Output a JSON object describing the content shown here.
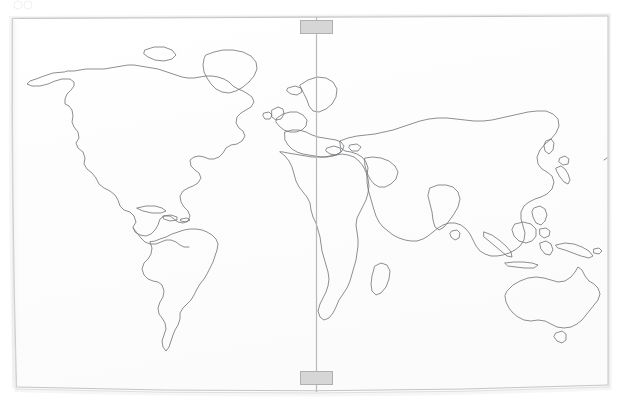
{
  "canvas": {
    "width": 621,
    "height": 403,
    "background_color": "#ffffff",
    "paper_fill": "#fefefe",
    "paper_border_color": "#c9c9c9",
    "paper_shadow_color": "#e8e8e8"
  },
  "map": {
    "title": "World map outline",
    "projection_note": "equirectangular world outline",
    "outline_color": "#6f7276",
    "outline_width": 0.8,
    "fill": "none",
    "frame": {
      "left": 11,
      "top": 17,
      "right": 608,
      "bottom": 385,
      "border_color": "#c4c4c4"
    }
  },
  "guide_line": {
    "name": "vertical-guide-line",
    "orientation": "vertical",
    "x": 316,
    "y_start": 17,
    "y_end": 392,
    "color": "#b9b9b9",
    "width": 1.2
  },
  "handles": [
    {
      "name": "top-handle",
      "x": 300,
      "y": 20,
      "width": 32,
      "height": 13,
      "fill": "#d6d6d6",
      "border_color": "#b0b0b0"
    },
    {
      "name": "bottom-handle",
      "x": 300,
      "y": 371,
      "width": 32,
      "height": 13,
      "fill": "#d6d6d6",
      "border_color": "#b0b0b0"
    }
  ],
  "landmasses": [
    {
      "name": "north-america"
    },
    {
      "name": "greenland"
    },
    {
      "name": "central-america"
    },
    {
      "name": "caribbean-islands"
    },
    {
      "name": "south-america"
    },
    {
      "name": "europe"
    },
    {
      "name": "british-isles"
    },
    {
      "name": "scandinavia"
    },
    {
      "name": "iceland"
    },
    {
      "name": "africa"
    },
    {
      "name": "madagascar"
    },
    {
      "name": "arabian-peninsula"
    },
    {
      "name": "asia"
    },
    {
      "name": "india"
    },
    {
      "name": "japan"
    },
    {
      "name": "southeast-asia-islands"
    },
    {
      "name": "philippines"
    },
    {
      "name": "new-guinea"
    },
    {
      "name": "australia"
    },
    {
      "name": "new-zealand"
    },
    {
      "name": "sri-lanka"
    },
    {
      "name": "mediterranean-islands"
    }
  ]
}
